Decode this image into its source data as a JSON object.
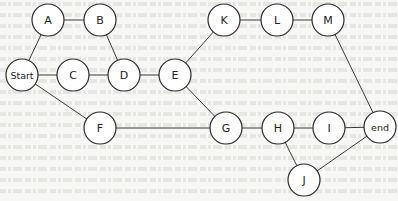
{
  "diagram": {
    "type": "network-graph",
    "background": "#f7f7f5",
    "node_stroke": "#2a2a2a",
    "edge_color": "#3a3a3a",
    "nodes": [
      {
        "id": "A",
        "label": "A",
        "x": 48,
        "y": 20
      },
      {
        "id": "B",
        "label": "B",
        "x": 100,
        "y": 20
      },
      {
        "id": "Start",
        "label": "Start",
        "x": 22,
        "y": 75
      },
      {
        "id": "C",
        "label": "C",
        "x": 73,
        "y": 75
      },
      {
        "id": "D",
        "label": "D",
        "x": 124,
        "y": 75
      },
      {
        "id": "E",
        "label": "E",
        "x": 175,
        "y": 75
      },
      {
        "id": "K",
        "label": "K",
        "x": 224,
        "y": 20
      },
      {
        "id": "L",
        "label": "L",
        "x": 277,
        "y": 20
      },
      {
        "id": "M",
        "label": "M",
        "x": 328,
        "y": 20
      },
      {
        "id": "F",
        "label": "F",
        "x": 100,
        "y": 128
      },
      {
        "id": "G",
        "label": "G",
        "x": 226,
        "y": 128
      },
      {
        "id": "H",
        "label": "H",
        "x": 278,
        "y": 128
      },
      {
        "id": "I",
        "label": "I",
        "x": 329,
        "y": 128
      },
      {
        "id": "end",
        "label": "end",
        "x": 380,
        "y": 127
      },
      {
        "id": "J",
        "label": "J",
        "x": 304,
        "y": 180
      }
    ],
    "edges": [
      [
        "Start",
        "A"
      ],
      [
        "A",
        "B"
      ],
      [
        "B",
        "D"
      ],
      [
        "Start",
        "C"
      ],
      [
        "C",
        "D"
      ],
      [
        "D",
        "E"
      ],
      [
        "E",
        "K"
      ],
      [
        "K",
        "L"
      ],
      [
        "L",
        "M"
      ],
      [
        "M",
        "end"
      ],
      [
        "E",
        "G"
      ],
      [
        "Start",
        "F"
      ],
      [
        "F",
        "G"
      ],
      [
        "G",
        "H"
      ],
      [
        "H",
        "I"
      ],
      [
        "I",
        "end"
      ],
      [
        "H",
        "J"
      ],
      [
        "J",
        "end"
      ]
    ],
    "node_radius": 16
  }
}
